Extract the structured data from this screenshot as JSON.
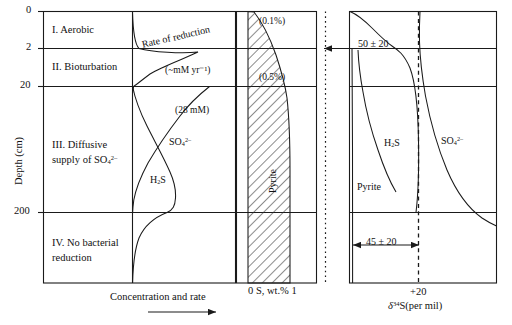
{
  "figure": {
    "type": "scientific-diagram",
    "caption_axes": {
      "y_axis_title": "Depth (cm)",
      "y_ticks": [
        "0",
        "2",
        "20",
        "200"
      ],
      "left_panel_x_title": "Concentration and rate",
      "middle_panel_x_title_left": "0",
      "middle_panel_x_title_mid": "S, wt.%",
      "middle_panel_x_title_right": "1",
      "right_panel_x_tick": "+20",
      "right_panel_x_title_pre": "δ",
      "right_panel_x_title_sup": "34",
      "right_panel_x_title_post": "S(per mil)"
    },
    "zones": [
      {
        "id": "zone-1",
        "label": "I. Aerobic"
      },
      {
        "id": "zone-2",
        "label": "II. Bioturbation"
      },
      {
        "id": "zone-3",
        "label_line1": "III. Diffusive",
        "label_line2_pre": "supply of SO",
        "label_line2_sub": "4",
        "label_line2_sup": "2–"
      },
      {
        "id": "zone-4",
        "label_line1": "IV. No bacterial",
        "label_line2": "reduction"
      }
    ],
    "left_panel": {
      "curves": [
        {
          "name": "rate-of-reduction",
          "label": "Rate of reduction",
          "unit_label": "(~mM yr⁻¹)"
        },
        {
          "name": "sulfate",
          "label_pre": "SO",
          "label_sub": "4",
          "label_sup": "2–",
          "value_label": "(28 mM)"
        },
        {
          "name": "hydrogen-sulfide",
          "label_pre": "H",
          "label_sub": "2",
          "label_post": "S"
        }
      ]
    },
    "middle_panel": {
      "shaded_region_label": "Pyrite",
      "annotations": [
        "(0.1%)",
        "(0.5%)"
      ]
    },
    "right_panel": {
      "curves": [
        {
          "name": "h2s-isotope",
          "label_pre": "H",
          "label_sub": "2",
          "label_post": "S"
        },
        {
          "name": "sulfate-isotope",
          "label_pre": "SO",
          "label_sub": "4",
          "label_sup": "2–"
        },
        {
          "name": "pyrite-isotope",
          "label": "Pyrite"
        }
      ],
      "annotations": [
        {
          "name": "fractionation-top",
          "text": "50 ± 20"
        },
        {
          "name": "fractionation-bottom",
          "text": "45 ± 20"
        }
      ]
    },
    "colors": {
      "line": "#1a1a1a",
      "background": "#ffffff",
      "hatch": "#2b2b2b"
    }
  }
}
